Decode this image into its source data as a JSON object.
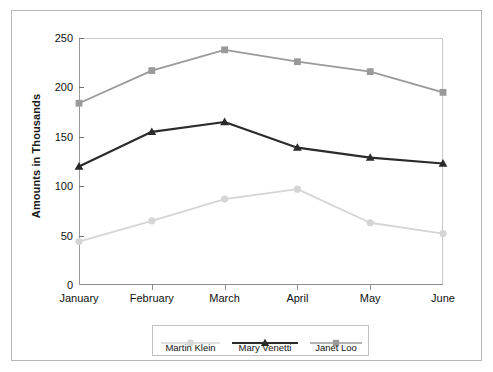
{
  "chart_data": {
    "type": "line",
    "title": "",
    "xlabel": "",
    "ylabel": "Amounts in Thousands",
    "categories": [
      "January",
      "February",
      "March",
      "April",
      "May",
      "June"
    ],
    "ylim": [
      0,
      250
    ],
    "yticks": [
      0,
      50,
      100,
      150,
      200,
      250
    ],
    "ytick_labels": [
      "0",
      "50",
      "100",
      "150",
      "200",
      "250"
    ],
    "grid": false,
    "legend_position": "bottom",
    "series": [
      {
        "name": "Martin Klein",
        "values": [
          44,
          65,
          87,
          97,
          63,
          52
        ],
        "color": "#d5d5d5",
        "marker": "circle"
      },
      {
        "name": "Mary Venetti",
        "values": [
          120,
          155,
          165,
          139,
          129,
          123
        ],
        "color": "#2b2b2b",
        "marker": "triangle"
      },
      {
        "name": "Janet Loo",
        "values": [
          184,
          217,
          238,
          226,
          216,
          195
        ],
        "color": "#9a9a9a",
        "marker": "square"
      }
    ]
  },
  "legend": {
    "entries": [
      {
        "label": "Martin Klein"
      },
      {
        "label": "Mary Venetti"
      },
      {
        "label": "Janet Loo"
      }
    ]
  },
  "colors": {
    "frame": "#b8b8b8",
    "axis": "#8e8e8e",
    "text": "#111111",
    "background": "#ffffff"
  }
}
